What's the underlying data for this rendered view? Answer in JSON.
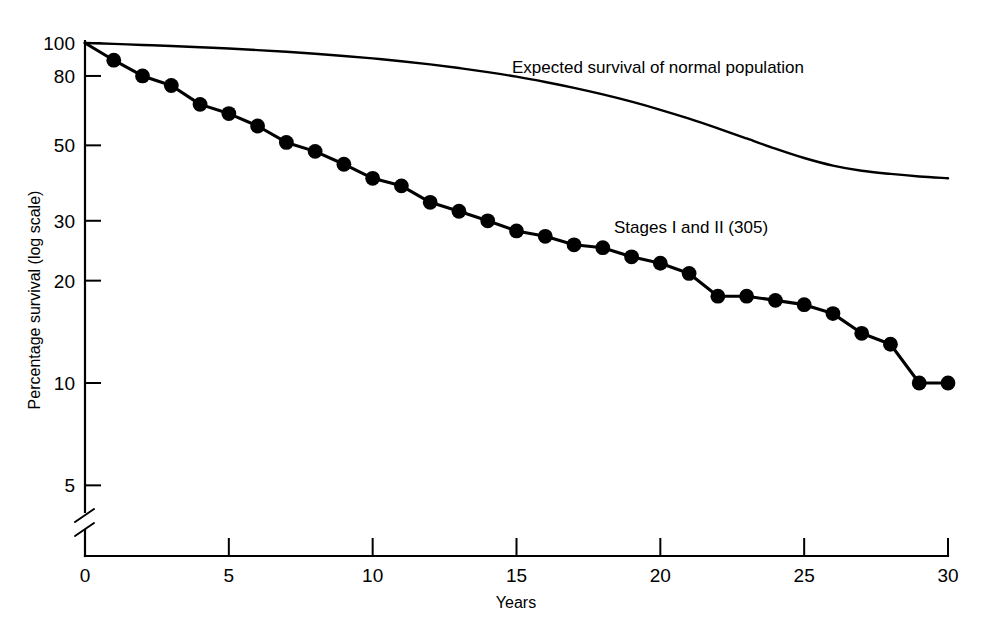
{
  "chart_data": {
    "type": "line",
    "title": "",
    "subtitle": "",
    "xlabel": "Years",
    "ylabel": "Percentage survival (log scale)",
    "yscale": "log",
    "xlim": [
      0,
      30
    ],
    "ylim": [
      4.5,
      100
    ],
    "grid": false,
    "legend_position": "inline-annotation",
    "axis_break": true,
    "axis_break_note": "y-axis broken below 5",
    "xticks": [
      "0",
      "5",
      "10",
      "15",
      "20",
      "25",
      "30"
    ],
    "xtick_values": [
      0,
      5,
      10,
      15,
      20,
      25,
      30
    ],
    "yticks": [
      "100",
      "80",
      "50",
      "30",
      "20",
      "10",
      "5"
    ],
    "ytick_values": [
      100,
      80,
      50,
      30,
      20,
      10,
      5
    ],
    "x": [
      0,
      1,
      2,
      3,
      4,
      5,
      6,
      7,
      8,
      9,
      10,
      11,
      12,
      13,
      14,
      15,
      16,
      17,
      18,
      19,
      20,
      21,
      22,
      23,
      24,
      25,
      26,
      27,
      28,
      29,
      30
    ],
    "series": [
      {
        "name": "Stages I and II (305)",
        "marker": "filled-circle",
        "values": [
          100,
          89,
          80,
          75,
          66,
          62,
          57,
          51,
          48,
          44,
          40,
          38,
          34,
          32,
          30,
          28,
          27,
          25.5,
          25,
          23.5,
          22.5,
          21,
          18,
          18,
          17.5,
          17,
          16,
          14,
          13,
          10,
          10
        ],
        "annotation": {
          "text": "Stages I and II (305)",
          "x": 20.5,
          "y": 28
        }
      },
      {
        "name": "Expected survival of normal population",
        "marker": "none",
        "values": [
          100,
          99.4,
          98.7,
          98,
          97.2,
          96.3,
          95.3,
          94.2,
          93,
          91.6,
          90.1,
          88.4,
          86.5,
          84.4,
          82.1,
          79.6,
          76.8,
          73.8,
          70.6,
          67.2,
          63.6,
          59.9,
          56.1,
          52.4,
          48.9,
          45.9,
          43.6,
          42.1,
          41.2,
          40.5,
          40
        ],
        "annotation": {
          "text": "Expected survival of normal population",
          "x": 17.7,
          "y": 84
        }
      }
    ]
  },
  "annotations": {
    "expected_label": "Expected survival of normal population",
    "stages_label": "Stages I and II (305)"
  },
  "axes": {
    "x_title": "Years",
    "y_title": "Percentage survival (log scale)"
  },
  "colors": {
    "ink": "#000000",
    "background": "#ffffff"
  }
}
